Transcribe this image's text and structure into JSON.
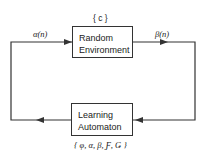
{
  "diagram": {
    "environment": {
      "line1": "Random",
      "line2": "Environment",
      "parameter": "{ c }"
    },
    "automaton": {
      "line1": "Learning",
      "line2": "Automaton",
      "parameter": "{ φ, α, β, Ƒ, Ǥ }"
    },
    "input_label": "α(n)",
    "output_label": "β(n)"
  }
}
